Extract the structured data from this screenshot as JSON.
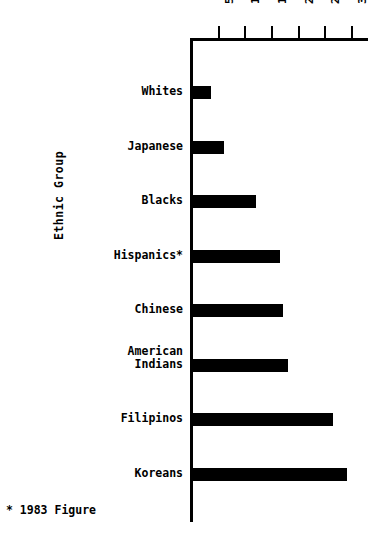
{
  "chart_data": {
    "type": "bar",
    "orientation": "horizontal",
    "title": "",
    "xlabel": "",
    "ylabel": "Ethnic Group",
    "categories": [
      "Whites",
      "Japanese",
      "Blacks",
      "Hispanics*",
      "Chinese",
      "American\nIndians",
      "Filipinos",
      "Koreans"
    ],
    "values": [
      3.5,
      6,
      12,
      16.5,
      17,
      18,
      26.5,
      29
    ],
    "xlim": [
      0,
      33
    ],
    "xticks": [
      5,
      10,
      15,
      20,
      25,
      30
    ],
    "xticklabels": [
      "5",
      "10",
      "15",
      "20",
      "25",
      "30"
    ],
    "grid": false,
    "legend": null,
    "annotations": [
      "* 1983 Figure"
    ],
    "bar_color": "#000000"
  },
  "axis": {
    "y_title": "Ethnic Group",
    "ticks": [
      {
        "label": "5",
        "value": 5
      },
      {
        "label": "10",
        "value": 10
      },
      {
        "label": "15",
        "value": 15
      },
      {
        "label": "20",
        "value": 20
      },
      {
        "label": "25",
        "value": 25
      },
      {
        "label": "30",
        "value": 30
      }
    ]
  },
  "bars": [
    {
      "label": "Whites",
      "value": 3.5,
      "multiline": false
    },
    {
      "label": "Japanese",
      "value": 6,
      "multiline": false
    },
    {
      "label": "Blacks",
      "value": 12,
      "multiline": false
    },
    {
      "label": "Hispanics*",
      "value": 16.5,
      "multiline": false
    },
    {
      "label": "Chinese",
      "value": 17,
      "multiline": false
    },
    {
      "label": "American Indians",
      "value": 18,
      "multiline": true
    },
    {
      "label": "Filipinos",
      "value": 26.5,
      "multiline": false
    },
    {
      "label": "Koreans",
      "value": 29,
      "multiline": false
    }
  ],
  "footnote": "* 1983 Figure"
}
